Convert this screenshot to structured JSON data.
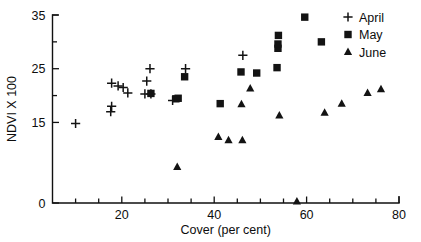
{
  "chart_data": {
    "type": "scatter",
    "title": "",
    "xlabel": "Cover (per cent)",
    "ylabel": "NDVI X 100",
    "xlim": [
      5,
      80
    ],
    "ylim": [
      0,
      35
    ],
    "xticks": [
      20,
      40,
      60,
      80
    ],
    "xtick_labels": [
      "20",
      "40",
      "60",
      "80"
    ],
    "xticks_minor": [
      10,
      15,
      25,
      30,
      35,
      45,
      50,
      55,
      65,
      70,
      75
    ],
    "yticks": [
      0,
      15,
      25,
      35
    ],
    "ytick_labels": [
      "0",
      "15",
      "25",
      "35"
    ],
    "yticks_minor": [
      20,
      30
    ],
    "grid": false,
    "legend_position": "top-right",
    "series": [
      {
        "name": "April",
        "marker": "plus",
        "points": [
          [
            10.0,
            14.8
          ],
          [
            17.6,
            17.0
          ],
          [
            17.8,
            18.0
          ],
          [
            17.8,
            22.3
          ],
          [
            19.2,
            21.8
          ],
          [
            20.3,
            21.5
          ],
          [
            21.3,
            20.5
          ],
          [
            25.0,
            20.3
          ],
          [
            25.4,
            22.7
          ],
          [
            26.1,
            25.0
          ],
          [
            26.3,
            20.3
          ],
          [
            31.0,
            19.1
          ],
          [
            33.8,
            25.0
          ],
          [
            46.2,
            27.5
          ]
        ]
      },
      {
        "name": "May",
        "marker": "square",
        "points": [
          [
            26.3,
            20.4
          ],
          [
            31.7,
            19.4
          ],
          [
            32.2,
            19.5
          ],
          [
            33.6,
            23.5
          ],
          [
            41.3,
            18.5
          ],
          [
            45.8,
            24.4
          ],
          [
            49.2,
            24.2
          ],
          [
            53.6,
            25.2
          ],
          [
            53.8,
            28.8
          ],
          [
            53.8,
            29.6
          ],
          [
            53.9,
            31.2
          ],
          [
            59.6,
            34.6
          ],
          [
            63.2,
            30.0
          ]
        ]
      },
      {
        "name": "June",
        "marker": "triangle",
        "points": [
          [
            32.0,
            6.7
          ],
          [
            40.9,
            12.3
          ],
          [
            43.1,
            11.7
          ],
          [
            46.1,
            11.7
          ],
          [
            45.9,
            18.4
          ],
          [
            47.8,
            21.3
          ],
          [
            54.1,
            16.3
          ],
          [
            57.9,
            0.3
          ],
          [
            63.9,
            16.8
          ],
          [
            67.6,
            18.5
          ],
          [
            73.2,
            20.5
          ],
          [
            76.1,
            21.2
          ]
        ]
      }
    ],
    "legend": [
      {
        "label": "April",
        "marker": "plus"
      },
      {
        "label": "May",
        "marker": "square"
      },
      {
        "label": "June",
        "marker": "triangle"
      }
    ]
  },
  "colors": {
    "ink": "#131313",
    "background": "#ffffff"
  }
}
